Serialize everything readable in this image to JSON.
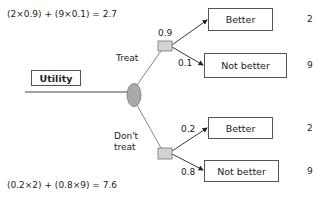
{
  "diagram": {
    "type": "decision-tree",
    "root_label": "Utility",
    "formulas": {
      "treat": "(2×0.9) + (9×0.1) = 2.7",
      "dont_treat": "(0.2×2) + (0.8×9) = 7.6"
    },
    "branches": [
      {
        "label": "Treat",
        "outcomes": [
          {
            "probability": "0.9",
            "label": "Better",
            "utility": "2"
          },
          {
            "probability": "0.1",
            "label": "Not better",
            "utility": "9"
          }
        ]
      },
      {
        "label_line1": "Don't",
        "label_line2": "treat",
        "outcomes": [
          {
            "probability": "0.2",
            "label": "Better",
            "utility": "2"
          },
          {
            "probability": "0.8",
            "label": "Not better",
            "utility": "9"
          }
        ]
      }
    ],
    "colors": {
      "line": "#555555",
      "node_fill": "#a9a9a9",
      "chance_fill": "#d3d3d3"
    }
  }
}
